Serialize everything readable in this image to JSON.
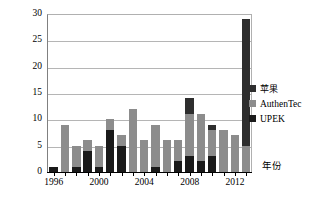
{
  "chart_data": {
    "type": "bar",
    "stacked": true,
    "title": "",
    "xlabel": "年份",
    "ylabel": "申请量/项",
    "ylim": [
      0,
      30
    ],
    "yticks": [
      0,
      5,
      10,
      15,
      20,
      25,
      30
    ],
    "xtick_labels": [
      "1996",
      "2000",
      "2004",
      "2008",
      "2012"
    ],
    "xtick_years": [
      1996,
      2000,
      2004,
      2008,
      2012
    ],
    "grid": true,
    "legend_position": "right",
    "categories": [
      1996,
      1997,
      1998,
      1999,
      2000,
      2001,
      2002,
      2003,
      2004,
      2005,
      2006,
      2007,
      2008,
      2009,
      2010,
      2011,
      2012,
      2013
    ],
    "series": [
      {
        "name": "UPEK",
        "color": "#1a1a1a",
        "values": [
          1,
          0,
          1,
          4,
          1,
          8,
          5,
          0,
          0,
          1,
          0,
          2,
          3,
          2,
          3,
          0,
          0,
          0
        ]
      },
      {
        "name": "AuthenTec",
        "color": "#8c8c8c",
        "values": [
          0,
          9,
          4,
          2,
          4,
          2,
          2,
          12,
          6,
          8,
          6,
          4,
          8,
          9,
          5,
          8,
          7,
          5
        ]
      },
      {
        "name": "苹果",
        "color": "#2e2e2e",
        "values": [
          0,
          0,
          0,
          0,
          0,
          0,
          0,
          0,
          0,
          0,
          0,
          0,
          3,
          0,
          1,
          0,
          0,
          24
        ]
      }
    ],
    "totals": [
      1,
      9,
      5,
      6,
      5,
      10,
      7,
      12,
      6,
      9,
      6,
      6,
      14,
      11,
      9,
      8,
      7,
      29
    ]
  },
  "legend": {
    "items": [
      {
        "label": "苹果",
        "cjk": true
      },
      {
        "label": "AuthenTec",
        "cjk": false
      },
      {
        "label": "UPEK",
        "cjk": false
      }
    ]
  }
}
